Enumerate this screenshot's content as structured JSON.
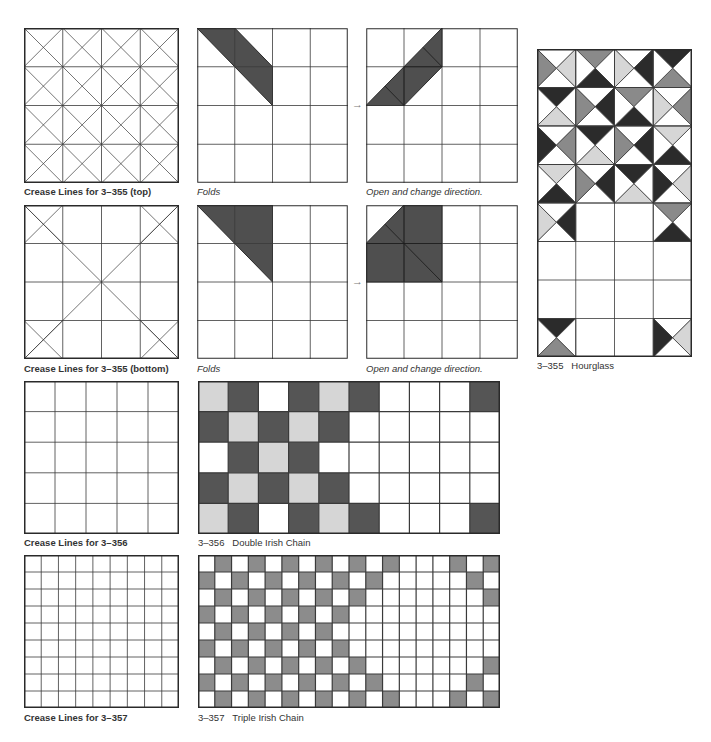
{
  "colors": {
    "line": "#3a3a3a",
    "frame": "#2a2a2a",
    "fold_fill": "#4f4f4f",
    "light": "#d6d6d6",
    "medium": "#8a8a8a",
    "dark": "#555555",
    "darkest": "#2b2b2b",
    "chain_gray": "#8c8c8c",
    "white": "#ffffff"
  },
  "captions": {
    "crease_355_top": "Crease Lines for 3–355 (top)",
    "folds_top": "Folds",
    "open_top": "Open and change direction.",
    "crease_355_bottom": "Crease Lines for 3–355 (bottom)",
    "folds_bottom": "Folds",
    "open_bottom": "Open and change direction.",
    "hourglass": "3–355   Hourglass",
    "crease_356": "Crease Lines for 3–356",
    "double_irish": "3–356   Double Irish Chain",
    "crease_357": "Crease Lines for 3–357",
    "triple_irish": "3–357   Triple Irish Chain"
  },
  "arrows": {
    "top": "→",
    "bottom": "→"
  },
  "figures": {
    "crease_355_top": {
      "grid": 4,
      "diagonals": "all_cells"
    },
    "crease_355_bottom": {
      "grid": 4,
      "diagonals": "corner_cells_and_main"
    },
    "folds_top": {
      "grid": 4,
      "shaded_polygons": [
        [
          [
            0,
            0
          ],
          [
            1,
            0
          ],
          [
            2,
            1
          ],
          [
            2,
            2
          ],
          [
            1,
            1
          ]
        ]
      ]
    },
    "open_top": {
      "grid": 4,
      "shaded_polygons": [
        [
          [
            2,
            0
          ],
          [
            2,
            1
          ],
          [
            1,
            2
          ],
          [
            0,
            2
          ],
          [
            1,
            1
          ]
        ]
      ],
      "inner_lines": [
        [
          [
            1,
            1
          ],
          [
            2,
            1
          ]
        ],
        [
          [
            1,
            1
          ],
          [
            1,
            2
          ]
        ],
        [
          [
            1.5,
            0.5
          ],
          [
            2,
            1
          ]
        ],
        [
          [
            0.5,
            1.5
          ],
          [
            1,
            2
          ]
        ]
      ]
    },
    "folds_bottom": {
      "grid": 4,
      "shaded_polygons": [
        [
          [
            0,
            0
          ],
          [
            2,
            0
          ],
          [
            2,
            2
          ]
        ]
      ]
    },
    "open_bottom": {
      "grid": 4,
      "shaded_polygons": [
        [
          [
            1,
            0
          ],
          [
            2,
            0
          ],
          [
            2,
            2
          ],
          [
            0,
            2
          ],
          [
            0,
            1
          ]
        ]
      ],
      "inner_lines": [
        [
          [
            0,
            1
          ],
          [
            2,
            1
          ]
        ],
        [
          [
            1,
            0
          ],
          [
            1,
            2
          ]
        ],
        [
          [
            0.5,
            0.5
          ],
          [
            1,
            1
          ]
        ],
        [
          [
            1,
            1
          ],
          [
            2,
            2
          ]
        ]
      ]
    },
    "crease_356": {
      "grid": 5
    },
    "crease_357": {
      "grid": 9
    },
    "hourglass": {
      "cols": 4,
      "rows": 8,
      "legend": "each cell = [top, right, bottom, left]; W=white, L=light, M=medium, D=dark",
      "cells": [
        [
          [
            "W",
            "L",
            "W",
            "M"
          ],
          [
            "M",
            "W",
            "D",
            "W"
          ],
          [
            "W",
            "D",
            "W",
            "L"
          ],
          [
            "D",
            "W",
            "M",
            "W"
          ]
        ],
        [
          [
            "D",
            "W",
            "L",
            "W"
          ],
          [
            "W",
            "D",
            "W",
            "M"
          ],
          [
            "M",
            "W",
            "D",
            "W"
          ],
          [
            "W",
            "M",
            "W",
            "L"
          ]
        ],
        [
          [
            "W",
            "M",
            "W",
            "D"
          ],
          [
            "D",
            "W",
            "L",
            "W"
          ],
          [
            "W",
            "D",
            "W",
            "M"
          ],
          [
            "L",
            "W",
            "D",
            "W"
          ]
        ],
        [
          [
            "L",
            "W",
            "D",
            "W"
          ],
          [
            "W",
            "D",
            "W",
            "M"
          ],
          [
            "D",
            "W",
            "L",
            "W"
          ],
          [
            "W",
            "L",
            "W",
            "D"
          ]
        ],
        [
          [
            "W",
            "D",
            "W",
            "L"
          ],
          null,
          null,
          [
            "M",
            "W",
            "D",
            "W"
          ]
        ],
        [
          null,
          null,
          null,
          null
        ],
        [
          null,
          null,
          null,
          null
        ],
        [
          [
            "D",
            "W",
            "M",
            "W"
          ],
          null,
          null,
          [
            "W",
            "L",
            "W",
            "D"
          ]
        ]
      ]
    },
    "double_irish": {
      "cols": 10,
      "rows": 5,
      "legend": "L=light, D=dark, W=white",
      "cells": [
        [
          "L",
          "D",
          "W",
          "D",
          "L",
          "D",
          "W",
          "W",
          "W",
          "D"
        ],
        [
          "D",
          "L",
          "D",
          "L",
          "D",
          "W",
          "W",
          "W",
          "W",
          "W"
        ],
        [
          "W",
          "D",
          "L",
          "D",
          "W",
          "W",
          "W",
          "W",
          "W",
          "W"
        ],
        [
          "D",
          "L",
          "D",
          "L",
          "D",
          "W",
          "W",
          "W",
          "W",
          "W"
        ],
        [
          "L",
          "D",
          "W",
          "D",
          "L",
          "D",
          "W",
          "W",
          "W",
          "D"
        ]
      ]
    },
    "triple_irish": {
      "cols": 18,
      "rows": 9,
      "legend": "G=gray, W=white",
      "cells": [
        [
          "W",
          "G",
          "W",
          "G",
          "W",
          "G",
          "W",
          "G",
          "W",
          "G",
          "W",
          "G",
          "W",
          "W",
          "W",
          "G",
          "W",
          "G"
        ],
        [
          "G",
          "W",
          "G",
          "W",
          "G",
          "W",
          "G",
          "W",
          "G",
          "W",
          "G",
          "W",
          "W",
          "W",
          "W",
          "W",
          "G",
          "W"
        ],
        [
          "W",
          "G",
          "W",
          "G",
          "W",
          "G",
          "W",
          "G",
          "W",
          "G",
          "W",
          "W",
          "W",
          "W",
          "W",
          "W",
          "W",
          "G"
        ],
        [
          "G",
          "W",
          "G",
          "W",
          "G",
          "W",
          "G",
          "W",
          "G",
          "W",
          "W",
          "W",
          "W",
          "W",
          "W",
          "W",
          "W",
          "W"
        ],
        [
          "W",
          "G",
          "W",
          "G",
          "W",
          "G",
          "W",
          "G",
          "W",
          "W",
          "W",
          "W",
          "W",
          "W",
          "W",
          "W",
          "W",
          "W"
        ],
        [
          "G",
          "W",
          "G",
          "W",
          "G",
          "W",
          "G",
          "W",
          "G",
          "W",
          "W",
          "W",
          "W",
          "W",
          "W",
          "W",
          "W",
          "W"
        ],
        [
          "W",
          "G",
          "W",
          "G",
          "W",
          "G",
          "W",
          "G",
          "W",
          "G",
          "W",
          "W",
          "W",
          "W",
          "W",
          "W",
          "W",
          "G"
        ],
        [
          "G",
          "W",
          "G",
          "W",
          "G",
          "W",
          "G",
          "W",
          "G",
          "W",
          "G",
          "W",
          "W",
          "W",
          "W",
          "W",
          "G",
          "W"
        ],
        [
          "W",
          "G",
          "W",
          "G",
          "W",
          "G",
          "W",
          "G",
          "W",
          "G",
          "W",
          "G",
          "W",
          "W",
          "W",
          "G",
          "W",
          "G"
        ]
      ]
    }
  }
}
